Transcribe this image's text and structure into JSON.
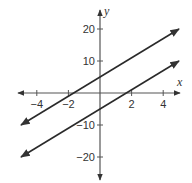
{
  "chart_data": {
    "type": "line",
    "title": "",
    "xlabel": "x",
    "ylabel": "y",
    "xlim": [
      -5,
      5
    ],
    "ylim": [
      -25,
      25
    ],
    "grid": false,
    "x_ticks": [
      -4,
      -2,
      2,
      4
    ],
    "x_tick_labels": [
      "−4",
      "−2",
      "2",
      "4"
    ],
    "y_ticks": [
      20,
      10,
      -10,
      -20
    ],
    "y_tick_labels": [
      "20",
      "10",
      "−10",
      "−20"
    ],
    "series": [
      {
        "name": "upper line",
        "equation": "y = 3x + 5",
        "x": [
          -5,
          5
        ],
        "y": [
          -10,
          20
        ],
        "arrows": "both"
      },
      {
        "name": "lower line",
        "equation": "y = 3x - 5",
        "x": [
          -5,
          5
        ],
        "y": [
          -20,
          10
        ],
        "arrows": "both"
      }
    ],
    "colors": {
      "line": "#2a2a2a",
      "axis": "#555555"
    }
  }
}
